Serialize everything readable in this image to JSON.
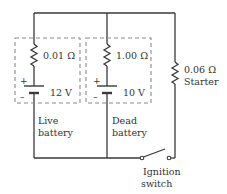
{
  "diagram": {
    "type": "circuit",
    "branches": [
      {
        "id": "live",
        "resistance": "0.01 Ω",
        "emf": "12 V",
        "caption_line1": "Live",
        "caption_line2": "battery",
        "plus": "+",
        "minus": "–"
      },
      {
        "id": "dead",
        "resistance": "1.00 Ω",
        "emf": "10 V",
        "caption_line1": "Dead",
        "caption_line2": "battery",
        "plus": "+",
        "minus": "–"
      },
      {
        "id": "starter",
        "resistance": "0.06 Ω",
        "caption": "Starter"
      }
    ],
    "switch": {
      "caption_line1": "Ignition",
      "caption_line2": "switch",
      "state": "open"
    },
    "colors": {
      "wire": "#3a3a3a",
      "dashed_box": "#8a8a8a",
      "text": "#333333",
      "background": "#ffffff"
    }
  }
}
